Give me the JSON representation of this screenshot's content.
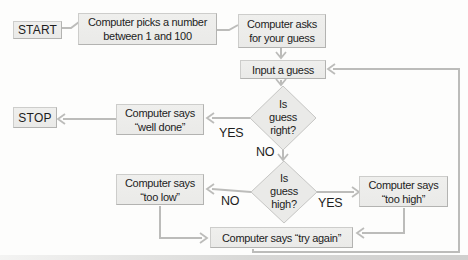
{
  "meta": {
    "type": "flowchart",
    "topic": "Computer number guessing game"
  },
  "colors": {
    "node_fill": "#eaeae8",
    "node_border": "#cdcdcb",
    "line": "#bcbcba",
    "text": "#1d1d1d",
    "bg": "#fdfdfc"
  },
  "nodes": {
    "start": {
      "label": "START"
    },
    "pick": {
      "line1": "Computer picks a number",
      "line2": "between 1 and 100"
    },
    "ask": {
      "line1": "Computer asks",
      "line2": "for your guess"
    },
    "input": {
      "label": "Input a guess"
    },
    "is_right": {
      "line1": "Is",
      "line2": "guess",
      "line3": "right?"
    },
    "well_done": {
      "line1": "Computer says",
      "line2": "“well done”"
    },
    "stop": {
      "label": "STOP"
    },
    "is_high": {
      "line1": "Is",
      "line2": "guess",
      "line3": "high?"
    },
    "too_low": {
      "line1": "Computer says",
      "line2": "“too low”"
    },
    "too_high": {
      "line1": "Computer says",
      "line2": "“too high”"
    },
    "try_again": {
      "label": "Computer says “try again”"
    }
  },
  "edge_labels": {
    "right_yes": "YES",
    "right_no": "NO",
    "high_no": "NO",
    "high_yes": "YES"
  }
}
